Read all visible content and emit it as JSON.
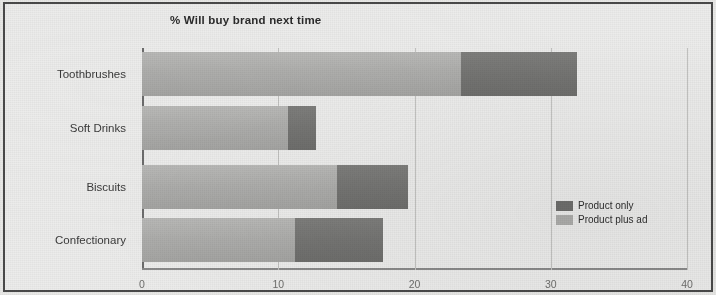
{
  "chart_data": {
    "type": "bar",
    "orientation": "horizontal",
    "stacked": true,
    "title": "% Will buy brand next time",
    "xlabel": "",
    "ylabel": "",
    "xlim": [
      0,
      40
    ],
    "xticks": [
      "0",
      "10",
      "20",
      "30",
      "40"
    ],
    "xtick_values": [
      0,
      10,
      20,
      30,
      40
    ],
    "grid": true,
    "legend_position": "inside bottom-right",
    "categories": [
      "Toothbrushes",
      "Soft Drinks",
      "Biscuits",
      "Confectionary"
    ],
    "series": [
      {
        "name": "Product plus ad",
        "color": "#aeaeac",
        "values": [
          23.4,
          10.7,
          14.3,
          11.2
        ]
      },
      {
        "name": "Product only",
        "color": "#6f6f6d",
        "values": [
          8.5,
          2.1,
          5.2,
          6.5
        ]
      }
    ],
    "totals": [
      31.9,
      12.8,
      19.5,
      17.7
    ]
  },
  "legend": {
    "items": [
      {
        "label": "Product only",
        "swatch": "#6f6f6d"
      },
      {
        "label": "Product plus ad",
        "swatch": "#aeaeac"
      }
    ]
  }
}
